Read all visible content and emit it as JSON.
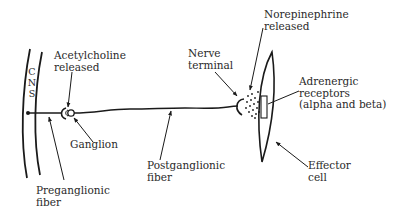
{
  "diagram": {
    "type": "sympathetic adrenergic neuron pathway",
    "colors": {
      "ink": "#1a1a1a",
      "background": "#ffffff"
    },
    "cns_letters": [
      "C",
      "N",
      "S"
    ],
    "labels": {
      "acetylcholine_line1": "Acetylcholine",
      "acetylcholine_line2": "released",
      "ganglion": "Ganglion",
      "preganglionic_line1": "Preganglionic",
      "preganglionic_line2": "fiber",
      "postganglionic_line1": "Postganglionic",
      "postganglionic_line2": "fiber",
      "nerve_terminal_line1": "Nerve",
      "nerve_terminal_line2": "terminal",
      "norepinephrine_line1": "Norepinephrine",
      "norepinephrine_line2": "released",
      "adrenergic_line1": "Adrenergic",
      "adrenergic_line2": "receptors",
      "adrenergic_line3": "(alpha and beta)",
      "effector_line1": "Effector",
      "effector_line2": "cell"
    }
  }
}
